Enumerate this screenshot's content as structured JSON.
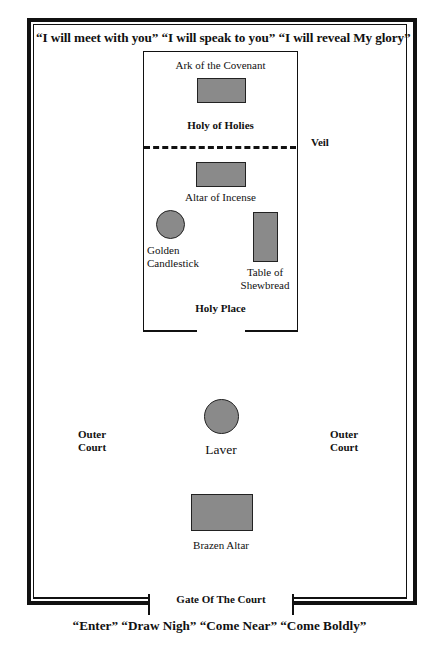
{
  "diagram": {
    "top_caption": "“I will meet with you”  “I will speak to you”  “I will reveal My glory”",
    "bottom_caption": "“Enter”  “Draw Nigh”  “Come Near”  “Come Boldly”",
    "gate_label": "Gate Of The Court",
    "veil_label": "Veil",
    "holy_of_holies": {
      "title": "Holy of Holies",
      "items": [
        {
          "label": "Ark of the Covenant",
          "shape": "rectangle"
        }
      ]
    },
    "holy_place": {
      "title": "Holy Place",
      "items": [
        {
          "label": "Altar of Incense",
          "shape": "rectangle"
        },
        {
          "label_line1": "Golden",
          "label_line2": "Candlestick",
          "shape": "circle"
        },
        {
          "label_line1": "Table of",
          "label_line2": "Shewbread",
          "shape": "rectangle"
        }
      ]
    },
    "outer_court": {
      "left_label_line1": "Outer",
      "left_label_line2": "Court",
      "right_label_line1": "Outer",
      "right_label_line2": "Court",
      "items": [
        {
          "label": "Laver",
          "shape": "circle"
        },
        {
          "label": "Brazen Altar",
          "shape": "rectangle"
        }
      ]
    },
    "colors": {
      "line": "#111111",
      "furniture_fill": "#8a8a8a",
      "background": "#ffffff"
    }
  }
}
